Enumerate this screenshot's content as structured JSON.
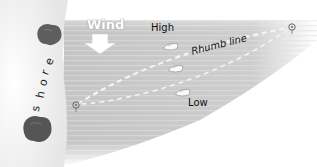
{
  "diagram": {
    "wind_label": "Wind",
    "high_label": "High",
    "low_label": "Low",
    "rhumb_label": "Rhumb line",
    "shore_label": "shore",
    "shore_letters": [
      "s",
      "h",
      "o",
      "r",
      "e"
    ]
  },
  "colors": {
    "water": "#c8c8c8",
    "water_stripe": "#dadada",
    "shore": "#f4f4f4",
    "tree": "#5a5a5a",
    "dash": "#f2f2f2"
  }
}
